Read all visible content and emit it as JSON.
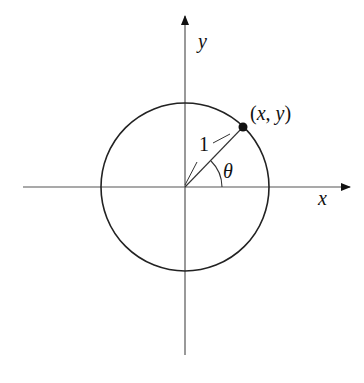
{
  "diagram": {
    "labels": {
      "x_axis": "x",
      "y_axis": "y",
      "point": "(x, y)",
      "radius": "1",
      "angle": "θ"
    },
    "colors": {
      "stroke": "#222222",
      "axis": "#555555",
      "background": "#ffffff"
    },
    "geometry": {
      "center": [
        185,
        187
      ],
      "radius_px": 84,
      "angle_deg": 45
    }
  }
}
